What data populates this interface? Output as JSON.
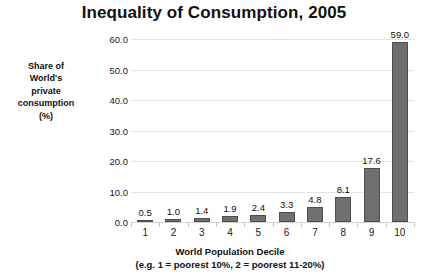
{
  "chart_data": {
    "type": "bar",
    "title": "Inequality of Consumption, 2005",
    "xlabel": "World Population Decile",
    "xlabel_note": "(e.g. 1 = poorest 10%, 2 = poorest 11-20%)",
    "ylabel": "Share of World's private consumption (%)",
    "ylabel_lines": [
      "Share of",
      "World's",
      "private",
      "consumption",
      "(%)"
    ],
    "categories": [
      "1",
      "2",
      "3",
      "4",
      "5",
      "6",
      "7",
      "8",
      "9",
      "10"
    ],
    "values": [
      0.5,
      1.0,
      1.4,
      1.9,
      2.4,
      3.3,
      4.8,
      8.1,
      17.6,
      59.0
    ],
    "data_labels": [
      "0.5",
      "1.0",
      "1.4",
      "1.9",
      "2.4",
      "3.3",
      "4.8",
      "8.1",
      "17.6",
      "59.0"
    ],
    "ylim": [
      0.0,
      60.0
    ],
    "ytick_values": [
      0.0,
      10.0,
      20.0,
      30.0,
      40.0,
      50.0,
      60.0
    ],
    "ytick_labels": [
      "0.0",
      "10.0",
      "20.0",
      "30.0",
      "40.0",
      "50.0",
      "60.0"
    ],
    "grid": true,
    "legend": false,
    "bar_color": "#6f6f6f",
    "bar_border_color": "#4e4e4e",
    "gridline_color": "#e3e3e3",
    "background_color": "#ffffff",
    "text_color": "#111111"
  }
}
